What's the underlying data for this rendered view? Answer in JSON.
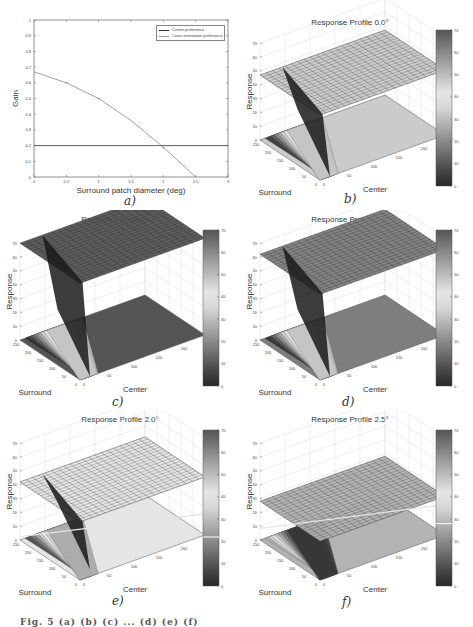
{
  "figure": {
    "footer_caption": "Fig. 5 (a) (b) (c) ... (d) (e) (f)"
  },
  "chart_data": [
    {
      "id": "a",
      "type": "line",
      "title": "",
      "caption": "a)",
      "xlabel": "Surround patch diameter (deg)",
      "ylabel": "Gain",
      "xlim": [
        0,
        3
      ],
      "ylim": [
        0,
        1
      ],
      "xticks": [
        "0",
        "0.5",
        "1",
        "1.5",
        "2",
        "2.5",
        "3"
      ],
      "yticks": [
        "0",
        "0.1",
        "0.2",
        "0.3",
        "0.4",
        "0.5",
        "0.6",
        "0.7",
        "0.8",
        "0.9",
        "1"
      ],
      "grid": false,
      "legend_position": "upper right",
      "series": [
        {
          "name": "Center preference",
          "x": [
            0,
            3
          ],
          "y": [
            0.2,
            0.2
          ],
          "color": "#333333"
        },
        {
          "name": "Cross orientation preference",
          "x": [
            0,
            0.5,
            1,
            1.5,
            2,
            2.5
          ],
          "y": [
            0.67,
            0.6,
            0.5,
            0.36,
            0.19,
            0.0
          ],
          "markers_at": [
            0.5,
            1,
            2
          ],
          "color": "#888888"
        }
      ]
    },
    {
      "id": "b",
      "type": "surface",
      "caption": "b)",
      "title": "Response Profile 0.0°",
      "xlabel": "Surround",
      "ylabel": "Center",
      "zlabel": "Response",
      "axis_ticks": [
        "0",
        "50",
        "100",
        "150",
        "200",
        "250"
      ],
      "zticks": [
        "0",
        "10",
        "20",
        "30",
        "40",
        "50",
        "60",
        "70"
      ],
      "colorbar_ticks": [
        "0",
        "10",
        "20",
        "30",
        "40",
        "50",
        "60",
        "70"
      ],
      "plateau_response": 47,
      "min_response": 0,
      "peak_response": 70
    },
    {
      "id": "c",
      "type": "surface",
      "caption": "c)",
      "title": "Response Profile 0.5°",
      "xlabel": "Surround",
      "ylabel": "Center",
      "zlabel": "Response",
      "axis_ticks": [
        "0",
        "50",
        "100",
        "150",
        "200",
        "250"
      ],
      "zticks": [
        "0",
        "10",
        "20",
        "30",
        "40",
        "50",
        "60",
        "70"
      ],
      "colorbar_ticks": [
        "0",
        "10",
        "20",
        "30",
        "40",
        "50",
        "60",
        "70"
      ],
      "plateau_response": 70,
      "min_response": 0,
      "peak_response": 70
    },
    {
      "id": "d",
      "type": "surface",
      "caption": "d)",
      "title": "Response Profile 1.0°",
      "xlabel": "Surround",
      "ylabel": "Center",
      "zlabel": "Response",
      "axis_ticks": [
        "0",
        "50",
        "100",
        "150",
        "200",
        "250"
      ],
      "zticks": [
        "0",
        "10",
        "20",
        "30",
        "40",
        "50",
        "60",
        "70"
      ],
      "colorbar_ticks": [
        "0",
        "10",
        "20",
        "30",
        "40",
        "50",
        "60",
        "70"
      ],
      "plateau_response": 62,
      "min_response": 0,
      "peak_response": 70
    },
    {
      "id": "e",
      "type": "surface",
      "caption": "e)",
      "title": "Response Profile 2.0°",
      "xlabel": "Surround",
      "ylabel": "Center",
      "zlabel": "Response",
      "axis_ticks": [
        "0",
        "50",
        "100",
        "150",
        "200",
        "250"
      ],
      "zticks": [
        "0",
        "10",
        "20",
        "30",
        "40",
        "50",
        "60",
        "70"
      ],
      "colorbar_ticks": [
        "0",
        "10",
        "20",
        "30",
        "40",
        "50",
        "60",
        "70"
      ],
      "plateau_response": 42,
      "min_response": 5,
      "peak_response": 45,
      "threshold_line": 22
    },
    {
      "id": "f",
      "type": "surface",
      "caption": "f)",
      "title": "Response Profile 2.5°",
      "xlabel": "Surround",
      "ylabel": "Center",
      "zlabel": "Response",
      "axis_ticks": [
        "0",
        "50",
        "100",
        "150",
        "200",
        "250"
      ],
      "zticks": [
        "0",
        "10",
        "20",
        "30",
        "40",
        "50",
        "60",
        "70"
      ],
      "colorbar_ticks": [
        "0",
        "10",
        "20",
        "30",
        "40",
        "50",
        "60",
        "70"
      ],
      "plateau_response": 28,
      "min_response": 28,
      "peak_response": 28,
      "threshold_line": 28
    }
  ]
}
